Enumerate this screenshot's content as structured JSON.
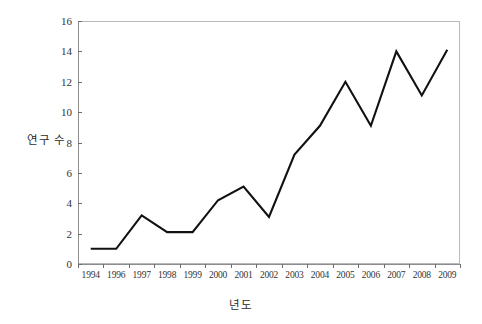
{
  "chart_data": {
    "type": "line",
    "title": "",
    "xlabel": "년도",
    "ylabel": "연구 수",
    "categories": [
      "1994",
      "1996",
      "1997",
      "1998",
      "1999",
      "2000",
      "2001",
      "2002",
      "2003",
      "2004",
      "2005",
      "2006",
      "2007",
      "2008",
      "2009"
    ],
    "values": [
      1.0,
      1.0,
      3.2,
      2.1,
      2.1,
      4.2,
      5.1,
      3.1,
      7.2,
      9.1,
      12.0,
      9.1,
      14.0,
      11.1,
      14.1
    ],
    "series": [
      {
        "name": "연구 수",
        "values": [
          1.0,
          1.0,
          3.2,
          2.1,
          2.1,
          4.2,
          5.1,
          3.1,
          7.2,
          9.1,
          12.0,
          9.1,
          14.0,
          11.1,
          14.1
        ]
      }
    ],
    "ylim": [
      0,
      16
    ],
    "y_ticks": [
      0,
      2,
      4,
      6,
      8,
      10,
      12,
      14,
      16
    ],
    "y_tick_labels": [
      "0",
      "2",
      "4",
      "6",
      "8",
      "10",
      "12",
      "14",
      "16"
    ],
    "x_tick_labels": [
      "1994",
      "1996",
      "1997",
      "1998",
      "1999",
      "2000",
      "2001",
      "2002",
      "2003",
      "2004",
      "2005",
      "2006",
      "2007",
      "2008",
      "2009"
    ],
    "grid": false,
    "legend": false,
    "legend_position": "none",
    "line_color": "#111111",
    "background_color": "#ffffff",
    "frame_color": "#b9b9b9"
  }
}
